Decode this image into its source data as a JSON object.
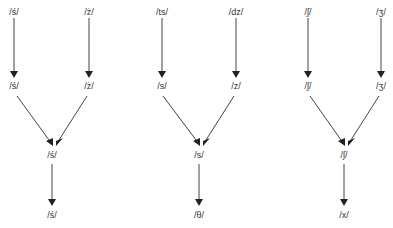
{
  "diagram": {
    "colors": {
      "line": "#444444",
      "text": "#333333",
      "background": "#ffffff"
    },
    "columns": [
      {
        "top": [
          "/ś/",
          "/ż/"
        ],
        "middle": [
          "/ś/",
          "/ż/"
        ],
        "merged": "/ś/",
        "bottom": "/ś/"
      },
      {
        "top": [
          "/ts/",
          "/dz/"
        ],
        "middle": [
          "/s/",
          "/z/"
        ],
        "merged": "/s/",
        "bottom": "/θ/"
      },
      {
        "top": [
          "/ʃ/",
          "/ʒ/"
        ],
        "middle": [
          "/ʃ/",
          "/ʒ/"
        ],
        "merged": "/ʃ/",
        "bottom": "/x/"
      }
    ]
  }
}
